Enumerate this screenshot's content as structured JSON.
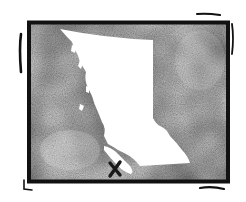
{
  "image": {
    "subject": "Hand-drawn map of British Columbia with location marker",
    "colors": {
      "background": "#ffffff",
      "frame": "#111111",
      "texture_dark": "#6b6b6b",
      "texture_light": "#bdbdbd",
      "land": "#ffffff",
      "marker": "#1a1a1a"
    }
  },
  "map": {
    "region": "british-columbia",
    "marker": {
      "icon": "x-mark-icon",
      "glyph": "✕"
    }
  }
}
